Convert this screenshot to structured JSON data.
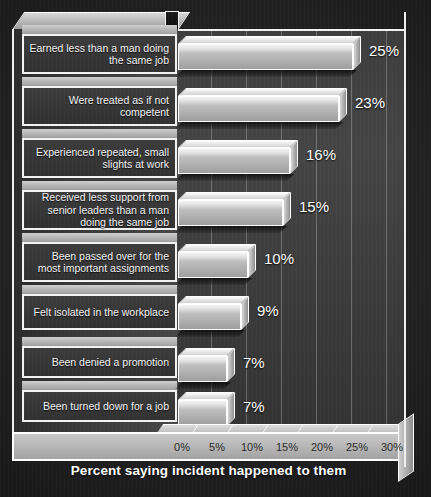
{
  "chart_data": {
    "type": "bar",
    "orientation": "horizontal",
    "title": "",
    "xlabel": "Percent saying incident happened to them",
    "ylabel": "",
    "xlim": [
      0,
      32
    ],
    "xticks": [
      "0%",
      "5%",
      "10%",
      "15%",
      "20%",
      "25%",
      "30%"
    ],
    "xtick_values": [
      0,
      5,
      10,
      15,
      20,
      25,
      30
    ],
    "grid": true,
    "legend": "none",
    "style": "3d-bars-grayscale",
    "categories": [
      "Earned less than a man doing the same job",
      "Were treated as if not competent",
      "Experienced repeated, small slights at work",
      "Received less support from senior leaders than a man doing the same job",
      "Been passed over for the most important assignments",
      "Felt isolated in the workplace",
      "Been denied a promotion",
      "Been turned down for a job"
    ],
    "values": [
      25,
      23,
      16,
      15,
      10,
      9,
      7,
      7
    ],
    "data_labels": [
      "25%",
      "23%",
      "16%",
      "15%",
      "10%",
      "9%",
      "7%",
      "7%"
    ]
  },
  "colors": {
    "background": "#141414",
    "plot_wall": "#3f3f3f",
    "bar_face": "#bdbdbd",
    "bar_top": "#f4f4f4",
    "frame": "#f2f2f2",
    "label_box": "#3c3c3c",
    "label_text": "#f4f4f4",
    "value_text": "#ffffff",
    "tick_text": "#2a2a2a",
    "axis_title_text": "#ffffff"
  }
}
